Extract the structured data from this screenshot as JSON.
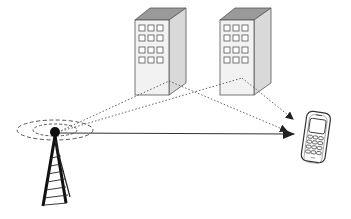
{
  "diagram": {
    "nodes": [
      {
        "id": "tower",
        "label": "base-station-tower",
        "icon": "tower-icon"
      },
      {
        "id": "building1",
        "label": "building-1",
        "icon": "building-icon"
      },
      {
        "id": "building2",
        "label": "building-2",
        "icon": "building-icon"
      },
      {
        "id": "phone",
        "label": "mobile-phone",
        "icon": "mobile-phone-icon"
      }
    ],
    "edges": [
      {
        "from": "tower",
        "to": "phone",
        "style": "solid",
        "type": "direct-path"
      },
      {
        "from": "tower",
        "to": "building1",
        "style": "dotted",
        "type": "incident"
      },
      {
        "from": "building1",
        "to": "phone",
        "style": "dotted",
        "type": "reflected"
      },
      {
        "from": "tower",
        "to": "building2",
        "style": "dotted",
        "type": "incident"
      },
      {
        "from": "building2",
        "to": "phone",
        "style": "dotted",
        "type": "reflected"
      }
    ],
    "colors": {
      "line": "#333333",
      "building_front": "#f2f2f2",
      "building_side": "#d9d9d9",
      "building_top": "#9a9a9a",
      "tower": "#111111"
    }
  }
}
